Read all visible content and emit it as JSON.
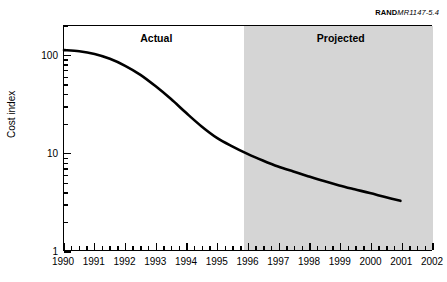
{
  "source_credit": {
    "bold_part": "RAND",
    "italic_part": "MR1147-5.4"
  },
  "axis_titles": {
    "y": "Cost index",
    "x": ""
  },
  "regions": [
    {
      "name": "actual",
      "label": "Actual",
      "x_center": 1993.0,
      "fill": "#ffffff"
    },
    {
      "name": "projected",
      "label": "Projected",
      "x_start": 1995.85,
      "x_end": 2002.0,
      "fill": "#d5d5d5"
    }
  ],
  "chart_data": {
    "type": "line",
    "title": "",
    "subtitle": "",
    "xlabel": "",
    "ylabel": "Cost index",
    "xlim": [
      1990,
      2002
    ],
    "ylim": [
      1,
      200
    ],
    "yscale": "log",
    "grid": false,
    "legend": null,
    "y_ticks_major": [
      1,
      10,
      100
    ],
    "y_tick_labels": [
      "1",
      "10",
      "100"
    ],
    "x_ticks_major": [
      1990,
      1991,
      1992,
      1993,
      1994,
      1995,
      1996,
      1997,
      1998,
      1999,
      2000,
      2001,
      2002
    ],
    "x_tick_labels": [
      "1990",
      "1991",
      "1992",
      "1993",
      "1994",
      "1995",
      "1996",
      "1997",
      "1998",
      "1999",
      "2000",
      "2001",
      "2002"
    ],
    "x_minor_per_interval": 3,
    "series": [
      {
        "name": "Cost index",
        "color": "#000000",
        "line_width": 2.6,
        "x": [
          1990.0,
          1990.5,
          1991.0,
          1991.5,
          1992.0,
          1992.5,
          1993.0,
          1993.5,
          1994.0,
          1994.5,
          1995.0,
          1995.5,
          1996.0,
          1996.5,
          1997.0,
          1997.5,
          1998.0,
          1998.5,
          1999.0,
          1999.5,
          2000.0,
          2000.5,
          2001.0
        ],
        "y": [
          113.0,
          110.0,
          103.0,
          92.0,
          78.0,
          63.0,
          48.0,
          35.5,
          25.5,
          18.6,
          14.2,
          11.6,
          9.7,
          8.3,
          7.2,
          6.4,
          5.7,
          5.1,
          4.6,
          4.2,
          3.85,
          3.5,
          3.2
        ]
      }
    ],
    "annotations": [
      {
        "text": "Actual",
        "x": 1993.0,
        "y": 150,
        "bold": true
      },
      {
        "text": "Projected",
        "x": 1999.0,
        "y": 150,
        "bold": true
      }
    ]
  }
}
